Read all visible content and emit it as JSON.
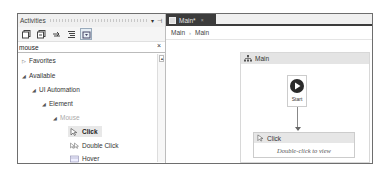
{
  "activities_panel": {
    "title": "Activities",
    "controls": {
      "pin": "▾",
      "dock": "⊣"
    },
    "toolbar": [
      {
        "name": "expand-all"
      },
      {
        "name": "collapse-all"
      },
      {
        "name": "refresh"
      },
      {
        "name": "sort"
      },
      {
        "name": "filter",
        "active": true
      }
    ],
    "search": {
      "value": "mouse",
      "clear": "×"
    },
    "tree": [
      {
        "label": "Favorites",
        "arrow": "▷",
        "level": 0
      },
      {
        "label": "Available",
        "arrow": "◢",
        "level": 0
      },
      {
        "label": "UI Automation",
        "arrow": "◢",
        "level": 1
      },
      {
        "label": "Element",
        "arrow": "◢",
        "level": 2
      },
      {
        "label": "Mouse",
        "arrow": "◢",
        "level": 3,
        "dim": true
      },
      {
        "label": "Click",
        "level": 4,
        "icon": "cursor",
        "selected": true
      },
      {
        "label": "Double Click",
        "level": 4,
        "icon": "double-cursor"
      },
      {
        "label": "Hover",
        "level": 4,
        "icon": "hover"
      }
    ]
  },
  "designer": {
    "tab": {
      "label": "Main*",
      "close": "×"
    },
    "breadcrumb": [
      "Main",
      "Main"
    ],
    "breadcrumb_sep": "›",
    "sequence": {
      "title": "Main"
    },
    "start_node": {
      "label": "Start"
    },
    "activity": {
      "title": "Click",
      "body": "Double-click to view"
    }
  }
}
